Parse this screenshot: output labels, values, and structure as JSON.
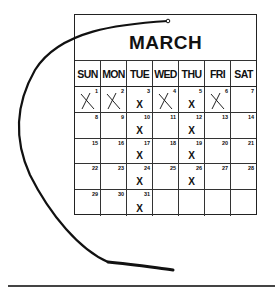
{
  "calendar": {
    "month": "MARCH",
    "weekdays": [
      "SUN",
      "MON",
      "TUE",
      "WED",
      "THU",
      "FRI",
      "SAT"
    ],
    "weeks": [
      [
        {
          "day": "1",
          "mark": "crossed"
        },
        {
          "day": "2",
          "mark": "crossed"
        },
        {
          "day": "3",
          "mark": "x"
        },
        {
          "day": "4",
          "mark": "crossed"
        },
        {
          "day": "5",
          "mark": "x"
        },
        {
          "day": "6",
          "mark": "crossed"
        },
        {
          "day": "7",
          "mark": ""
        }
      ],
      [
        {
          "day": "8",
          "mark": ""
        },
        {
          "day": "9",
          "mark": ""
        },
        {
          "day": "10",
          "mark": "x"
        },
        {
          "day": "11",
          "mark": ""
        },
        {
          "day": "12",
          "mark": "x"
        },
        {
          "day": "13",
          "mark": ""
        },
        {
          "day": "14",
          "mark": ""
        }
      ],
      [
        {
          "day": "15",
          "mark": ""
        },
        {
          "day": "16",
          "mark": ""
        },
        {
          "day": "17",
          "mark": "x"
        },
        {
          "day": "18",
          "mark": ""
        },
        {
          "day": "19",
          "mark": "x"
        },
        {
          "day": "20",
          "mark": ""
        },
        {
          "day": "21",
          "mark": ""
        }
      ],
      [
        {
          "day": "22",
          "mark": ""
        },
        {
          "day": "23",
          "mark": ""
        },
        {
          "day": "24",
          "mark": "x"
        },
        {
          "day": "25",
          "mark": ""
        },
        {
          "day": "26",
          "mark": "x"
        },
        {
          "day": "27",
          "mark": ""
        },
        {
          "day": "28",
          "mark": ""
        }
      ],
      [
        {
          "day": "29",
          "mark": ""
        },
        {
          "day": "30",
          "mark": ""
        },
        {
          "day": "31",
          "mark": "x"
        },
        {
          "day": "",
          "mark": ""
        },
        {
          "day": "",
          "mark": ""
        },
        {
          "day": "",
          "mark": ""
        },
        {
          "day": "",
          "mark": ""
        }
      ]
    ],
    "x_label": "X"
  }
}
